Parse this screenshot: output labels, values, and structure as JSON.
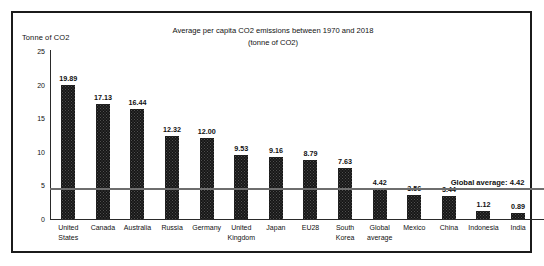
{
  "chart_data": {
    "type": "bar",
    "title": "Average per capita CO2 emissions between 1970 and 2018 (tonne of CO2)",
    "title_line1": "Average per capita CO2 emissions between 1970 and 2018",
    "title_line2": "(tonne of CO2)",
    "ylabel": "Tonne of CO2",
    "xlabel": "",
    "ylim": [
      0,
      25
    ],
    "yticks": [
      0,
      5,
      10,
      15,
      20,
      25
    ],
    "ytick_labels": [
      "0",
      "5",
      "10",
      "15",
      "20",
      "25"
    ],
    "grid": false,
    "legend": null,
    "bar_color": "#171717",
    "annotation_line": {
      "label": "Global average: 4.42",
      "value": 4.42,
      "color": "#6e6e6e"
    },
    "categories": [
      "United States",
      "Canada",
      "Australia",
      "Russia",
      "Germany",
      "United Kingdom",
      "Japan",
      "EU28",
      "South Korea",
      "Global average",
      "Mexico",
      "China",
      "Indonesia",
      "India"
    ],
    "values": [
      19.89,
      17.13,
      16.44,
      12.32,
      12.0,
      9.53,
      9.16,
      8.79,
      7.63,
      4.42,
      3.56,
      3.44,
      1.12,
      0.89
    ],
    "value_labels": [
      "19.89",
      "17.13",
      "16.44",
      "12.32",
      "12.00",
      "9.53",
      "9.16",
      "8.79",
      "7.63",
      "4.42",
      "3.56",
      "3.44",
      "1.12",
      "0.89"
    ]
  }
}
